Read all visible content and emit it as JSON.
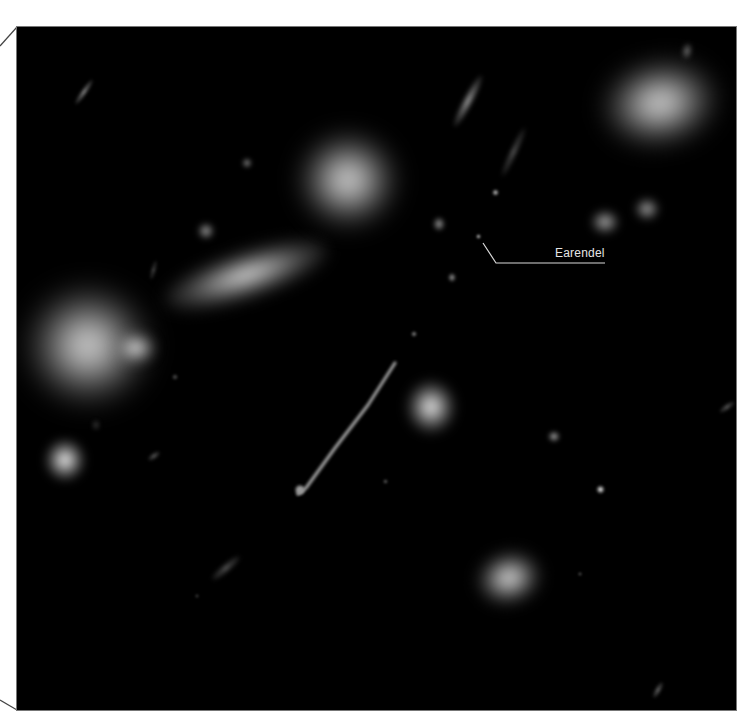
{
  "image": {
    "subject": "deep-field galaxy cluster with gravitationally lensed star",
    "background_color": "#000000",
    "page_background": "#ffffff",
    "frame_stroke": "#555555"
  },
  "annotation": {
    "label": "Earendel",
    "label_color": "#e6e6e6",
    "line_color": "#d9d9d9",
    "target_point": [
      478,
      236
    ],
    "line_points": [
      [
        483,
        243
      ],
      [
        496,
        263
      ],
      [
        605,
        263
      ]
    ]
  },
  "objects": [
    {
      "name": "galaxy-large-left",
      "x": 88,
      "y": 345,
      "w": 120,
      "h": 115,
      "rot": 0,
      "core": 0.95,
      "blur": 14
    },
    {
      "name": "galaxy-left-companion",
      "x": 136,
      "y": 348,
      "w": 40,
      "h": 32,
      "rot": 0,
      "core": 0.9,
      "blur": 6
    },
    {
      "name": "galaxy-elongated-center",
      "x": 246,
      "y": 275,
      "w": 170,
      "h": 46,
      "rot": -18,
      "core": 0.9,
      "blur": 8
    },
    {
      "name": "galaxy-round-top",
      "x": 348,
      "y": 180,
      "w": 96,
      "h": 92,
      "rot": 0,
      "core": 0.95,
      "blur": 12
    },
    {
      "name": "galaxy-top-right",
      "x": 660,
      "y": 103,
      "w": 112,
      "h": 82,
      "rot": -10,
      "core": 0.95,
      "blur": 12
    },
    {
      "name": "galaxy-mid-right-1",
      "x": 605,
      "y": 222,
      "w": 28,
      "h": 24,
      "rot": 0,
      "core": 0.8,
      "blur": 4
    },
    {
      "name": "galaxy-mid-right-2",
      "x": 647,
      "y": 209,
      "w": 24,
      "h": 22,
      "rot": 0,
      "core": 0.8,
      "blur": 4
    },
    {
      "name": "galaxy-center-round",
      "x": 431,
      "y": 407,
      "w": 48,
      "h": 52,
      "rot": 0,
      "core": 0.95,
      "blur": 6
    },
    {
      "name": "galaxy-bottom",
      "x": 509,
      "y": 578,
      "w": 62,
      "h": 50,
      "rot": -15,
      "core": 0.95,
      "blur": 8
    },
    {
      "name": "galaxy-left-lower",
      "x": 65,
      "y": 460,
      "w": 40,
      "h": 42,
      "rot": 0,
      "core": 0.95,
      "blur": 5
    },
    {
      "name": "arc-top-sliver",
      "x": 468,
      "y": 101,
      "w": 10,
      "h": 58,
      "rot": 28,
      "core": 0.75,
      "blur": 2
    },
    {
      "name": "arc-right-sliver",
      "x": 513,
      "y": 152,
      "w": 7,
      "h": 54,
      "rot": 25,
      "core": 0.55,
      "blur": 2
    },
    {
      "name": "arc-top-left-sliver",
      "x": 84,
      "y": 92,
      "w": 6,
      "h": 30,
      "rot": 35,
      "core": 0.7,
      "blur": 1.5
    },
    {
      "name": "arc-lower-left",
      "x": 226,
      "y": 568,
      "w": 8,
      "h": 36,
      "rot": 50,
      "core": 0.55,
      "blur": 2
    },
    {
      "name": "arc-left-small",
      "x": 154,
      "y": 456,
      "w": 6,
      "h": 14,
      "rot": 55,
      "core": 0.55,
      "blur": 1.5
    },
    {
      "name": "arc-far-right",
      "x": 727,
      "y": 407,
      "w": 6,
      "h": 18,
      "rot": 55,
      "core": 0.55,
      "blur": 1.5
    },
    {
      "name": "arc-bottom-right",
      "x": 658,
      "y": 690,
      "w": 6,
      "h": 18,
      "rot": 30,
      "core": 0.6,
      "blur": 1.5
    },
    {
      "name": "arc-left-vertical",
      "x": 153,
      "y": 270,
      "w": 5,
      "h": 20,
      "rot": 15,
      "core": 0.45,
      "blur": 1.5
    },
    {
      "name": "blob-a",
      "x": 206,
      "y": 231,
      "w": 16,
      "h": 16,
      "rot": 0,
      "core": 0.8,
      "blur": 3
    },
    {
      "name": "blob-b",
      "x": 247,
      "y": 163,
      "w": 10,
      "h": 10,
      "rot": 0,
      "core": 0.7,
      "blur": 2
    },
    {
      "name": "blob-c",
      "x": 439,
      "y": 224,
      "w": 12,
      "h": 14,
      "rot": 0,
      "core": 0.75,
      "blur": 2
    },
    {
      "name": "blob-d",
      "x": 495,
      "y": 192,
      "w": 7,
      "h": 7,
      "rot": 0,
      "core": 0.85,
      "blur": 1
    },
    {
      "name": "blob-e",
      "x": 452,
      "y": 277,
      "w": 8,
      "h": 9,
      "rot": 0,
      "core": 0.75,
      "blur": 1.5
    },
    {
      "name": "blob-f",
      "x": 554,
      "y": 436,
      "w": 12,
      "h": 11,
      "rot": 0,
      "core": 0.8,
      "blur": 2
    },
    {
      "name": "blob-g",
      "x": 600,
      "y": 489,
      "w": 9,
      "h": 9,
      "rot": 0,
      "core": 0.95,
      "blur": 1
    },
    {
      "name": "blob-h",
      "x": 414,
      "y": 334,
      "w": 6,
      "h": 6,
      "rot": 0,
      "core": 0.7,
      "blur": 1
    },
    {
      "name": "blob-i",
      "x": 385,
      "y": 481,
      "w": 5,
      "h": 5,
      "rot": 0,
      "core": 0.55,
      "blur": 1
    },
    {
      "name": "blob-j",
      "x": 580,
      "y": 574,
      "w": 4,
      "h": 4,
      "rot": 0,
      "core": 0.6,
      "blur": 1
    },
    {
      "name": "blob-k",
      "x": 175,
      "y": 377,
      "w": 6,
      "h": 6,
      "rot": 0,
      "core": 0.5,
      "blur": 1
    },
    {
      "name": "blob-l",
      "x": 687,
      "y": 51,
      "w": 10,
      "h": 16,
      "rot": 10,
      "core": 0.6,
      "blur": 2
    },
    {
      "name": "blob-m",
      "x": 197,
      "y": 596,
      "w": 4,
      "h": 4,
      "rot": 0,
      "core": 0.5,
      "blur": 1
    },
    {
      "name": "blob-n",
      "x": 96,
      "y": 425,
      "w": 8,
      "h": 10,
      "rot": 0,
      "core": 0.4,
      "blur": 2
    },
    {
      "name": "earendel-star",
      "x": 478,
      "y": 236,
      "w": 5,
      "h": 5,
      "rot": 0,
      "core": 0.9,
      "blur": 0.8
    }
  ],
  "arc_long": {
    "name": "lensed-arc-sunrise",
    "points": [
      [
        395,
        363
      ],
      [
        368,
        405
      ],
      [
        335,
        448
      ],
      [
        306,
        488
      ],
      [
        298,
        494
      ]
    ],
    "color": "#bfbfbf"
  }
}
